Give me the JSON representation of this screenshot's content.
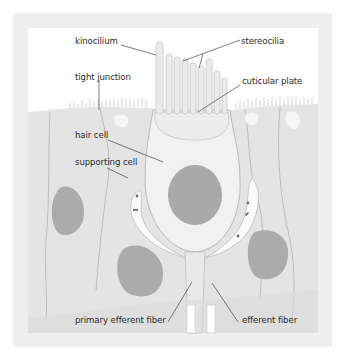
{
  "diagram": {
    "labels": {
      "kinocilium": "kinocilium",
      "stereocilia": "stereocilia",
      "tight_junction": "tight junction",
      "cuticular_plate": "cuticular plate",
      "hair_cell": "hair cell",
      "supporting_cell": "supporting cell",
      "primary_efferent_fiber": "primary efferent fiber",
      "efferent_fiber": "efferent fiber"
    },
    "colors": {
      "frame": "#efefef",
      "panel": "#ffffff",
      "tissue": "#e4e4e4",
      "cell_outline": "#b9b9b9",
      "hair_cell_fill": "#f1f1f1",
      "nucleus": "#a9a9a9",
      "cilia": "#e9e9e9",
      "leader_line": "#444444",
      "text": "#2a2a2a"
    }
  }
}
